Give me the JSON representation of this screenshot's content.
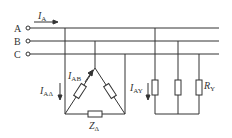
{
  "diagram": {
    "type": "three-phase-circuit",
    "phases": [
      {
        "label": "A",
        "y": 28
      },
      {
        "label": "B",
        "y": 41
      },
      {
        "label": "C",
        "y": 54
      }
    ],
    "line_current": {
      "symbol": "I",
      "subscript": "A"
    },
    "delta_load": {
      "line_current": {
        "symbol": "I",
        "subscript": "AΔ"
      },
      "phase_current": {
        "symbol": "I",
        "subscript": "AB"
      },
      "impedance": {
        "symbol": "Z",
        "subscript": "Δ"
      }
    },
    "wye_load": {
      "line_current": {
        "symbol": "I",
        "subscript": "AY"
      },
      "resistance": {
        "symbol": "R",
        "subscript": "Y"
      }
    },
    "colors": {
      "line": "#333333",
      "background": "#ffffff"
    }
  }
}
